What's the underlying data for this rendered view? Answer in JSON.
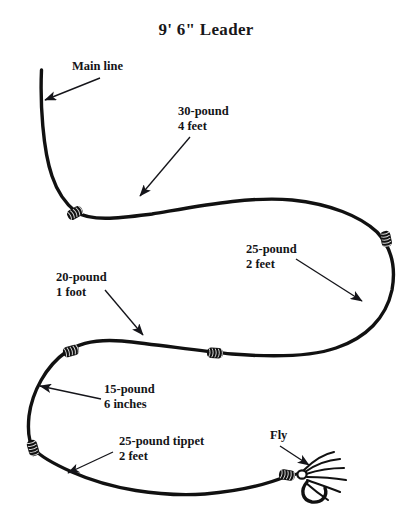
{
  "diagram": {
    "title": "9' 6\" Leader",
    "kind": "fly-fishing-leader-formula",
    "line_color": "#111111",
    "text_color": "#141417",
    "background_color": "#ffffff"
  },
  "annotations": [
    {
      "id": "main-line",
      "line1": "Main line",
      "line2": "",
      "label_x": 72,
      "label_y": 59,
      "arrow": {
        "x1": 100,
        "y1": 78,
        "x2": 45,
        "y2": 100
      }
    },
    {
      "id": "segment-30-pound",
      "line1": "30-pound",
      "line2": "4 feet",
      "label_x": 178,
      "label_y": 104,
      "arrow": {
        "x1": 190,
        "y1": 137,
        "x2": 140,
        "y2": 196
      }
    },
    {
      "id": "segment-25-pound-2-feet",
      "line1": "25-pound",
      "line2": "2 feet",
      "label_x": 246,
      "label_y": 242,
      "arrow": {
        "x1": 296,
        "y1": 259,
        "x2": 362,
        "y2": 301
      }
    },
    {
      "id": "segment-20-pound",
      "line1": "20-pound",
      "line2": "1 foot",
      "label_x": 56,
      "label_y": 270,
      "arrow": {
        "x1": 105,
        "y1": 290,
        "x2": 143,
        "y2": 335
      }
    },
    {
      "id": "segment-15-pound",
      "line1": "15-pound",
      "line2": "6 inches",
      "label_x": 104,
      "label_y": 382,
      "arrow": {
        "x1": 101,
        "y1": 399,
        "x2": 40,
        "y2": 386
      }
    },
    {
      "id": "segment-25-pound-tippet",
      "line1": "25-pound tippet",
      "line2": "2 feet",
      "label_x": 119,
      "label_y": 434,
      "arrow": {
        "x1": 113,
        "y1": 452,
        "x2": 68,
        "y2": 473
      }
    },
    {
      "id": "fly",
      "line1": "Fly",
      "line2": "",
      "label_x": 270,
      "label_y": 428,
      "arrow": {
        "x1": 280,
        "y1": 446,
        "x2": 309,
        "y2": 465
      }
    }
  ],
  "knots": [
    {
      "id": "knot-1",
      "x": 75,
      "y": 213,
      "rot": -28
    },
    {
      "id": "knot-2",
      "x": 386,
      "y": 239,
      "rot": 78
    },
    {
      "id": "knot-3",
      "x": 215,
      "y": 353,
      "rot": 3
    },
    {
      "id": "knot-4",
      "x": 71,
      "y": 351,
      "rot": -16
    },
    {
      "id": "knot-5",
      "x": 33,
      "y": 448,
      "rot": 74
    },
    {
      "id": "knot-6",
      "x": 287,
      "y": 475,
      "rot": 10
    }
  ],
  "leader_path": "M 41.5 70 C 40 104 43 150 52 176 C 58 194 66 204 76 212 C 92 222 120 218 152 214 C 200 206 250 196 292 200 C 330 204 360 216 377 232 C 392 248 396 268 392 290 C 386 318 366 338 336 348 C 310 357 270 357 232 354 C 200 351 160 345 122 341 C 98 339 80 342 66 352 C 46 366 32 392 29 416 C 27 436 30 444 34 449 C 40 456 54 464 72 472 C 110 489 160 497 205 494 C 240 491 268 484 287 476",
  "tippet_path": "M 287 476 C 292 476 296 474 300 473",
  "fly": {
    "body_x": 312,
    "body_y": 476,
    "hackles": [
      "M 304 470 C 314 460 324 454 334 452",
      "M 305 472 C 316 464 328 460 340 459",
      "M 306 474 C 318 470 332 468 344 468",
      "M 307 477 C 320 477 334 478 346 480",
      "M 307 480 C 318 484 330 488 340 492",
      "M 306 483 C 314 490 322 496 328 500"
    ],
    "hook": "M 307 482 C 300 490 302 500 312 502 C 322 503 328 496 325 488"
  }
}
